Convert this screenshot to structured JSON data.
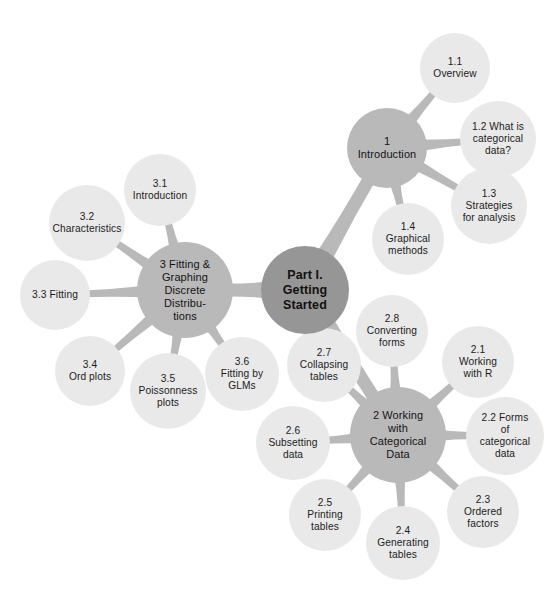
{
  "diagram": {
    "type": "mind-map",
    "title": "Part I. Getting Started",
    "background_color": "#ffffff",
    "colors": {
      "root_fill": "#969696",
      "section_fill": "#b9b9b9",
      "leaf_fill": "#e9e9e9",
      "connector": "#b9b9b9",
      "text": "#1a1a1a"
    }
  },
  "root": {
    "id": "root",
    "label": "Part I.\nGetting\nStarted",
    "cx": 305,
    "cy": 290,
    "r": 44
  },
  "sections": [
    {
      "id": "sec-1",
      "label": "1\nIntroduction",
      "cx": 387,
      "cy": 148,
      "r": 40,
      "children": [
        {
          "id": "n-1-1",
          "label": "1.1\nOverview",
          "cx": 455,
          "cy": 68,
          "r": 35
        },
        {
          "id": "n-1-2",
          "label": "1.2 What is\ncategorical\ndata?",
          "cx": 498,
          "cy": 139,
          "r": 38
        },
        {
          "id": "n-1-3",
          "label": "1.3\nStrategies\nfor analysis",
          "cx": 489,
          "cy": 206,
          "r": 38
        },
        {
          "id": "n-1-4",
          "label": "1.4\nGraphical\nmethods",
          "cx": 408,
          "cy": 239,
          "r": 36
        }
      ]
    },
    {
      "id": "sec-3",
      "label": "3 Fitting &\nGraphing\nDiscrete\nDistribu-\ntions",
      "cx": 185,
      "cy": 290,
      "r": 48,
      "children": [
        {
          "id": "n-3-1",
          "label": "3.1\nIntroduction",
          "cx": 160,
          "cy": 190,
          "r": 36
        },
        {
          "id": "n-3-2",
          "label": "3.2\nCharacteristics",
          "cx": 87,
          "cy": 223,
          "r": 38
        },
        {
          "id": "n-3-3",
          "label": "3.3 Fitting",
          "cx": 55,
          "cy": 295,
          "r": 35
        },
        {
          "id": "n-3-4",
          "label": "3.4\nOrd plots",
          "cx": 90,
          "cy": 371,
          "r": 35
        },
        {
          "id": "n-3-5",
          "label": "3.5\nPoissonness\nplots",
          "cx": 168,
          "cy": 391,
          "r": 38
        },
        {
          "id": "n-3-6",
          "label": "3.6\nFitting by\nGLMs",
          "cx": 242,
          "cy": 374,
          "r": 37
        }
      ]
    },
    {
      "id": "sec-2",
      "label": "2 Working\nwith\nCategorical\nData",
      "cx": 398,
      "cy": 435,
      "r": 48,
      "children": [
        {
          "id": "n-2-1",
          "label": "2.1\nWorking\nwith R",
          "cx": 478,
          "cy": 362,
          "r": 36
        },
        {
          "id": "n-2-2",
          "label": "2.2 Forms\nof\ncategorical\ndata",
          "cx": 505,
          "cy": 436,
          "r": 39
        },
        {
          "id": "n-2-3",
          "label": "2.3\nOrdered\nfactors",
          "cx": 483,
          "cy": 512,
          "r": 36
        },
        {
          "id": "n-2-4",
          "label": "2.4\nGenerating\ntables",
          "cx": 403,
          "cy": 543,
          "r": 37
        },
        {
          "id": "n-2-5",
          "label": "2.5\nPrinting\ntables",
          "cx": 325,
          "cy": 515,
          "r": 36
        },
        {
          "id": "n-2-6",
          "label": "2.6\nSubsetting\ndata",
          "cx": 293,
          "cy": 443,
          "r": 37
        },
        {
          "id": "n-2-7",
          "label": "2.7\nCollapsing\ntables",
          "cx": 324,
          "cy": 365,
          "r": 37
        },
        {
          "id": "n-2-8",
          "label": "2.8\nConverting\nforms",
          "cx": 392,
          "cy": 331,
          "r": 36
        }
      ]
    }
  ]
}
